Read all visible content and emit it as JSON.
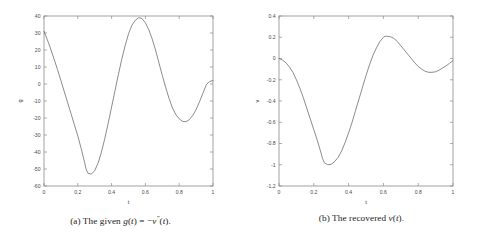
{
  "figure": {
    "background_color": "#ffffff",
    "curve_color": "#5a5a5a",
    "axis_color": "#8a8a8a",
    "text_color": "#4a4a4a"
  },
  "subfigures": [
    {
      "id": "subfig-a",
      "caption_tag": "(a)",
      "caption_text": "The given g(t) = −v″(t).",
      "caption_parts": {
        "lead": "(a) The given ",
        "func": "g",
        "arg_open": "(",
        "arg": "t",
        "arg_close": ")",
        "equals": " = ",
        "minus": "−",
        "rhs_func": "v",
        "rhs_prime": "″",
        "rhs_open": "(",
        "rhs_arg": "t",
        "rhs_close": ").",
        "full": "(a) The given g(t) = −v″(t)."
      }
    },
    {
      "id": "subfig-b",
      "caption_tag": "(b)",
      "caption_text": "The recovered v(t).",
      "caption_parts": {
        "lead": "(b) The recovered ",
        "func": "v",
        "arg_open": "(",
        "arg": "t",
        "arg_close": ").",
        "full": "(b) The recovered v(t)."
      }
    }
  ],
  "chart_data": [
    {
      "id": "plot-a",
      "type": "line",
      "title": "",
      "xlabel": "t",
      "ylabel": "g",
      "xlim": [
        0,
        1
      ],
      "ylim": [
        -60,
        40
      ],
      "xticks": [
        0,
        0.2,
        0.4,
        0.6,
        0.8,
        1
      ],
      "xticklabels": [
        "0",
        "0.2",
        "0.4",
        "0.6",
        "0.8",
        "1"
      ],
      "yticks": [
        -60,
        -50,
        -40,
        -30,
        -20,
        -10,
        0,
        10,
        20,
        30,
        40
      ],
      "yticklabels": [
        "-60",
        "-50",
        "-40",
        "-30",
        "-20",
        "-10",
        "0",
        "10",
        "20",
        "30",
        "40"
      ],
      "grid": false,
      "legend": null,
      "series": [
        {
          "name": "g(t)",
          "color": "#5a5a5a",
          "linewidth": 0.7,
          "x": [
            0.0,
            0.02,
            0.04,
            0.06,
            0.08,
            0.1,
            0.12,
            0.14,
            0.16,
            0.18,
            0.2,
            0.22,
            0.24,
            0.25,
            0.26,
            0.28,
            0.3,
            0.32,
            0.34,
            0.36,
            0.38,
            0.4,
            0.42,
            0.44,
            0.46,
            0.48,
            0.5,
            0.52,
            0.54,
            0.56,
            0.58,
            0.6,
            0.62,
            0.64,
            0.66,
            0.68,
            0.7,
            0.72,
            0.74,
            0.76,
            0.78,
            0.8,
            0.82,
            0.84,
            0.86,
            0.88,
            0.9,
            0.92,
            0.94,
            0.96,
            0.98,
            1.0
          ],
          "y": [
            31.0,
            26.0,
            20.5,
            14.5,
            8.5,
            2.0,
            -4.5,
            -11.0,
            -17.5,
            -24.0,
            -30.5,
            -38.0,
            -46.0,
            -50.5,
            -52.5,
            -53.0,
            -51.0,
            -46.5,
            -40.0,
            -32.0,
            -23.0,
            -13.5,
            -4.0,
            5.5,
            14.5,
            22.5,
            29.5,
            34.5,
            37.5,
            39.0,
            38.5,
            36.0,
            32.0,
            26.5,
            20.0,
            12.5,
            5.0,
            -2.0,
            -8.5,
            -14.0,
            -18.0,
            -20.5,
            -22.0,
            -22.2,
            -21.0,
            -18.5,
            -15.0,
            -10.5,
            -5.5,
            -0.5,
            1.5,
            2.0
          ]
        }
      ]
    },
    {
      "id": "plot-b",
      "type": "line",
      "title": "",
      "xlabel": "t",
      "ylabel": "v",
      "xlim": [
        0,
        1
      ],
      "ylim": [
        -1.2,
        0.4
      ],
      "xticks": [
        0,
        0.2,
        0.4,
        0.6,
        0.8,
        1
      ],
      "xticklabels": [
        "0",
        "0.2",
        "0.4",
        "0.6",
        "0.8",
        "1"
      ],
      "yticks": [
        -1.2,
        -1.0,
        -0.8,
        -0.6,
        -0.4,
        -0.2,
        0,
        0.2,
        0.4
      ],
      "yticklabels": [
        "-1.2",
        "-1",
        "-0.8",
        "-0.6",
        "-0.4",
        "-0.2",
        "0",
        "0.2",
        "0.4"
      ],
      "grid": false,
      "legend": null,
      "series": [
        {
          "name": "v(t)",
          "color": "#5a5a5a",
          "linewidth": 0.7,
          "x": [
            0.0,
            0.02,
            0.04,
            0.06,
            0.08,
            0.1,
            0.12,
            0.14,
            0.16,
            0.18,
            0.2,
            0.22,
            0.24,
            0.25,
            0.26,
            0.28,
            0.3,
            0.32,
            0.34,
            0.36,
            0.38,
            0.4,
            0.42,
            0.44,
            0.46,
            0.48,
            0.5,
            0.52,
            0.54,
            0.56,
            0.58,
            0.6,
            0.61,
            0.62,
            0.64,
            0.66,
            0.68,
            0.7,
            0.72,
            0.74,
            0.76,
            0.78,
            0.8,
            0.82,
            0.84,
            0.86,
            0.88,
            0.9,
            0.92,
            0.94,
            0.96,
            0.98,
            1.0
          ],
          "y": [
            0.0,
            -0.015,
            -0.04,
            -0.08,
            -0.13,
            -0.2,
            -0.28,
            -0.37,
            -0.47,
            -0.57,
            -0.67,
            -0.77,
            -0.88,
            -0.94,
            -0.98,
            -1.0,
            -0.995,
            -0.97,
            -0.93,
            -0.87,
            -0.79,
            -0.7,
            -0.6,
            -0.49,
            -0.38,
            -0.27,
            -0.16,
            -0.06,
            0.03,
            0.1,
            0.16,
            0.2,
            0.21,
            0.21,
            0.205,
            0.19,
            0.16,
            0.12,
            0.08,
            0.04,
            0.0,
            -0.04,
            -0.075,
            -0.1,
            -0.12,
            -0.13,
            -0.13,
            -0.125,
            -0.11,
            -0.09,
            -0.07,
            -0.045,
            -0.02
          ]
        }
      ]
    }
  ]
}
